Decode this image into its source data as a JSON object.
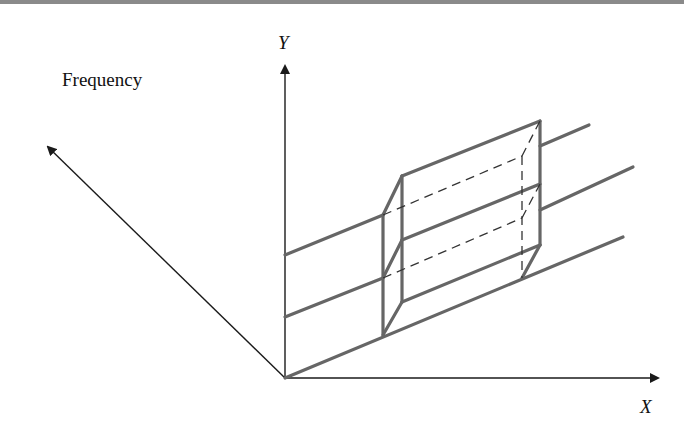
{
  "figure": {
    "axes": {
      "y_label": "Y",
      "x_label": "X",
      "depth_label": "Frequency"
    },
    "colors": {
      "axis": "#1a1a1a",
      "surface_lines": "#666666",
      "box_edges": "#666666",
      "hidden_edges": "#333333",
      "top_border": "#8a8a8a"
    }
  }
}
